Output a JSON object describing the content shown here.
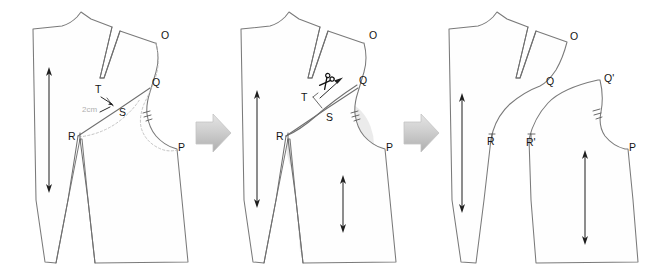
{
  "figure": {
    "type": "pattern-drafting-diagram",
    "background_color": "#ffffff",
    "outline_color": "#7a7a7a",
    "construction_color": "#b9b9b9",
    "shade_color": "#d8d8d8",
    "arrow_color": "#c9c9c9",
    "panel_count": 3
  },
  "panels": [
    {
      "id": "panel-1",
      "name": "original-block-with-markings",
      "labels": [
        {
          "key": "O",
          "text": "O",
          "x": 161,
          "y": 39
        },
        {
          "key": "Q",
          "text": "Q",
          "x": 152,
          "y": 86
        },
        {
          "key": "T",
          "text": "T",
          "x": 99,
          "y": 93
        },
        {
          "key": "S",
          "text": "S",
          "x": 119,
          "y": 116
        },
        {
          "key": "R",
          "text": "R",
          "x": 74,
          "y": 137
        },
        {
          "key": "P",
          "text": "P",
          "x": 178,
          "y": 151
        }
      ],
      "measurements": [
        {
          "key": "2cm",
          "text": "2cm",
          "x": 86,
          "y": 110
        }
      ]
    },
    {
      "id": "panel-2",
      "name": "cut-and-rotate-step",
      "labels": [
        {
          "key": "O",
          "text": "O",
          "x": 369,
          "y": 39
        },
        {
          "key": "Q",
          "text": "Q",
          "x": 359,
          "y": 84
        },
        {
          "key": "T",
          "text": "T",
          "x": 304,
          "y": 99
        },
        {
          "key": "S",
          "text": "S",
          "x": 326,
          "y": 119
        },
        {
          "key": "R",
          "text": "R",
          "x": 281,
          "y": 137
        },
        {
          "key": "P",
          "text": "P",
          "x": 386,
          "y": 151
        }
      ],
      "icons": [
        {
          "key": "scissors",
          "name": "scissors-icon",
          "x": 327,
          "y": 83
        }
      ]
    },
    {
      "id": "panel-3",
      "name": "separated-pieces-result",
      "labels": [
        {
          "key": "O",
          "text": "O",
          "x": 570,
          "y": 40
        },
        {
          "key": "Q",
          "text": "Q",
          "x": 551,
          "y": 85
        },
        {
          "key": "Qp",
          "text": "Q'",
          "x": 604,
          "y": 82
        },
        {
          "key": "R",
          "text": "R",
          "x": 490,
          "y": 143
        },
        {
          "key": "Rp",
          "text": "R'",
          "x": 532,
          "y": 144
        },
        {
          "key": "P",
          "text": "P",
          "x": 629,
          "y": 151
        }
      ]
    }
  ],
  "step_arrows": [
    {
      "key": "arrow-1",
      "name": "step-arrow-1-to-2",
      "x": 198,
      "y": 125
    },
    {
      "key": "arrow-2",
      "name": "step-arrow-2-to-3",
      "x": 406,
      "y": 125
    }
  ]
}
